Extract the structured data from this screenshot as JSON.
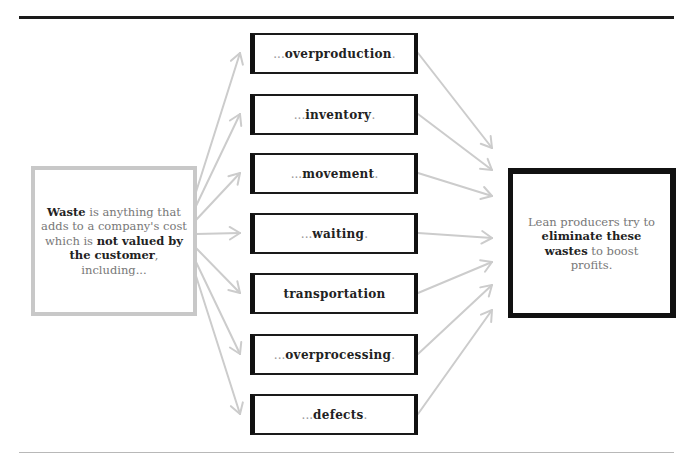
{
  "left_box": {
    "bold_1": "Waste",
    "text_1": " is anything that adds to a company's cost which is ",
    "bold_2": "not valued by the customer",
    "text_2": ", including..."
  },
  "wastes": [
    {
      "prefix": "...",
      "label": "overproduction",
      "suffix": "."
    },
    {
      "prefix": "...",
      "label": "inventory",
      "suffix": "."
    },
    {
      "prefix": "...",
      "label": "movement",
      "suffix": "."
    },
    {
      "prefix": "...",
      "label": "waiting",
      "suffix": "."
    },
    {
      "prefix": "",
      "label": "transportation",
      "suffix": ""
    },
    {
      "prefix": "...",
      "label": "overprocessing",
      "suffix": "."
    },
    {
      "prefix": "...",
      "label": "defects",
      "suffix": "."
    }
  ],
  "right_box": {
    "text_1": "Lean producers try to ",
    "bold_1": "eliminate these wastes",
    "text_2": " to boost profits."
  },
  "colors": {
    "arrow": "#cccccc",
    "box_border": "#111111",
    "left_border": "#c8c8c8"
  }
}
